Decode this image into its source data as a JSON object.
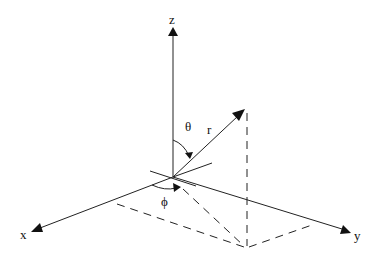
{
  "diagram": {
    "axes": {
      "x_label": "x",
      "y_label": "y",
      "z_label": "z"
    },
    "vector": {
      "label": "r"
    },
    "angles": {
      "polar_label": "θ",
      "azimuth_label": "ϕ"
    },
    "colors": {
      "line": "#222222",
      "background": "#ffffff"
    }
  }
}
